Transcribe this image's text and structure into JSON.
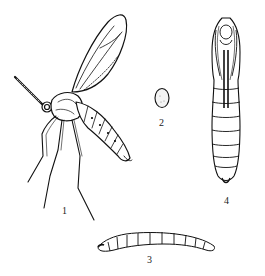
{
  "figure": {
    "background": "#ffffff",
    "ink_color": "#111111",
    "stages": [
      {
        "id": "adult",
        "label": "1",
        "description": "adult fly, lateral view"
      },
      {
        "id": "egg",
        "label": "2",
        "description": "egg"
      },
      {
        "id": "larva",
        "label": "3",
        "description": "larva"
      },
      {
        "id": "pupa",
        "label": "4",
        "description": "pupa, ventral view"
      }
    ]
  }
}
